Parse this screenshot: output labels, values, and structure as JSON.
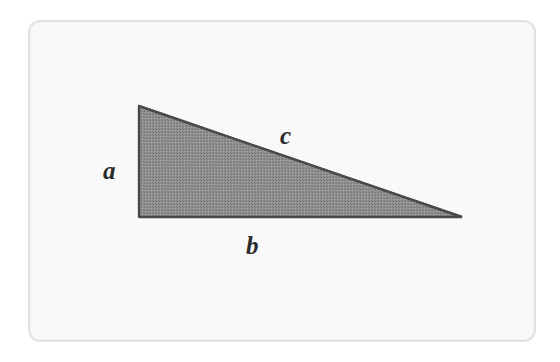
{
  "figure": {
    "background_color": "#ffffff",
    "frame": {
      "fill_color": "#fbfbfb",
      "border_color": "#e2e2e2",
      "corner_radius": 12
    },
    "shape": {
      "name": "right-triangle",
      "fill_color": "#8d8d8d",
      "stroke_color": "#4f4f4f",
      "stroke_width": 2,
      "vertices": [
        {
          "name": "apex",
          "x": 139,
          "y": 106
        },
        {
          "name": "bottom-left-right-angle",
          "x": 139,
          "y": 217
        },
        {
          "name": "bottom-right",
          "x": 462,
          "y": 217
        }
      ]
    },
    "labels": {
      "a": "a",
      "b": "b",
      "c": "c"
    },
    "label_color": "#2b2b2b"
  },
  "chart_data": {
    "type": "diagram",
    "shape": "right-triangle",
    "annotations": [
      {
        "label": "a",
        "side": "vertical-left-leg",
        "x": 113,
        "y": 170
      },
      {
        "label": "b",
        "side": "horizontal-bottom-leg",
        "x": 255,
        "y": 245
      },
      {
        "label": "c",
        "side": "hypotenuse",
        "x": 289,
        "y": 135
      }
    ],
    "vertices": [
      {
        "x": 139,
        "y": 106
      },
      {
        "x": 139,
        "y": 217
      },
      {
        "x": 462,
        "y": 217
      }
    ],
    "leg_a_length_px": 111,
    "leg_b_length_px": 323,
    "hypotenuse_c_length_px": 341,
    "right_angle_at": "bottom-left",
    "fill_color": "#8d8d8d",
    "stroke_color": "#4f4f4f"
  }
}
